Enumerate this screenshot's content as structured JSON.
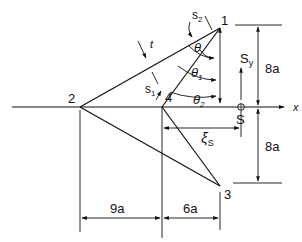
{
  "diagram": {
    "points": [
      {
        "id": "1",
        "label": "1",
        "x": 220,
        "y": 28
      },
      {
        "id": "2",
        "label": "2",
        "x": 80,
        "y": 107
      },
      {
        "id": "3",
        "label": "3",
        "x": 220,
        "y": 186
      },
      {
        "id": "4",
        "label": "4",
        "x": 162,
        "y": 107
      }
    ],
    "labels": {
      "s1": "s",
      "s1_sub": "1",
      "s2": "s",
      "s2_sub": "2",
      "t": "t",
      "theta": "θ",
      "theta1": "θ",
      "theta1_sub": "1",
      "theta2": "θ",
      "theta2_sub": "2",
      "Sy": "S",
      "Sy_sub": "y",
      "S": "S",
      "x_axis": "x",
      "xi_s": "ξ",
      "xi_s_sub": "S"
    },
    "dimensions": {
      "upper_height": "8a",
      "lower_height": "8a",
      "left_width": "9a",
      "right_width": "6a"
    },
    "colors": {
      "line": "#111111",
      "background": "#ffffff"
    }
  }
}
